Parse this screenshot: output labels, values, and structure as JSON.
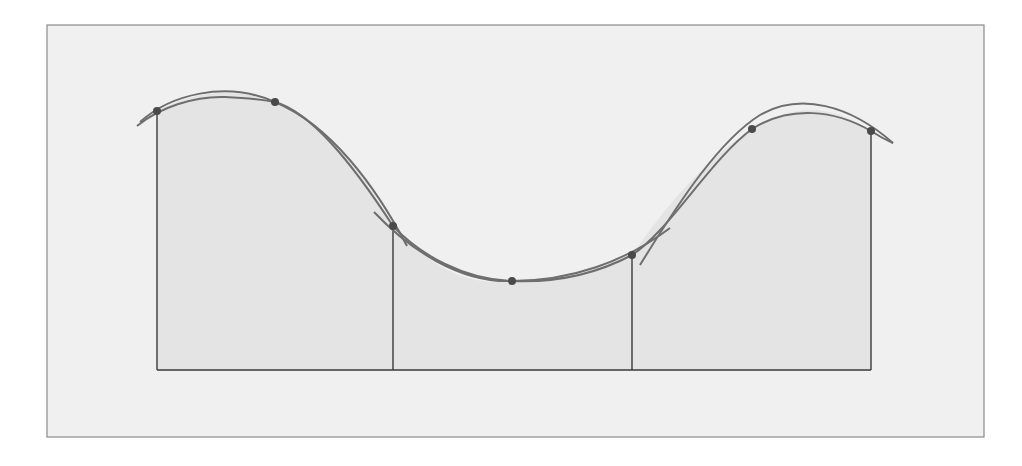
{
  "diagram": {
    "type": "simpsons-rule-illustration",
    "colors": {
      "page_background": "#ffffff",
      "frame_fill": "#f0f0f0",
      "frame_stroke": "#8a8a8a",
      "shaded_area": "#e4e4e4",
      "curve": "#6e6e6e",
      "ordinate_lines": "#3a3a3a",
      "points": "#4a4a4a"
    },
    "frame": {
      "x": 47,
      "y": 25,
      "width": 937,
      "height": 412
    },
    "baseline_y": 370,
    "points": [
      {
        "x": 157,
        "y": 111
      },
      {
        "x": 275,
        "y": 102
      },
      {
        "x": 393,
        "y": 226
      },
      {
        "x": 512,
        "y": 281
      },
      {
        "x": 632,
        "y": 255
      },
      {
        "x": 752,
        "y": 129
      },
      {
        "x": 871,
        "y": 131
      }
    ],
    "ordinates_x": [
      157,
      393,
      632,
      871
    ],
    "function_curve_path": "M137,126 C160,105 200,95 230,96 C265,97 300,115 330,140 C360,168 378,205 400,232 C430,262 470,283 540,283 C590,283 615,270 640,252 C680,215 715,150 752,120 C780,100 815,96 840,108 C860,118 875,133 893,143",
    "parabola_arcs": [
      {
        "through": [
          0,
          1,
          2
        ],
        "path": "M140,122 Q216,80 300,122 Q350,155 407,246"
      },
      {
        "through": [
          2,
          3,
          4
        ],
        "path": "M374,212 Q450,290 540,283 Q600,278 670,228"
      },
      {
        "through": [
          4,
          5,
          6
        ],
        "path": "M615,276 Q680,200 752,129 Q810,85 893,143"
      }
    ]
  }
}
